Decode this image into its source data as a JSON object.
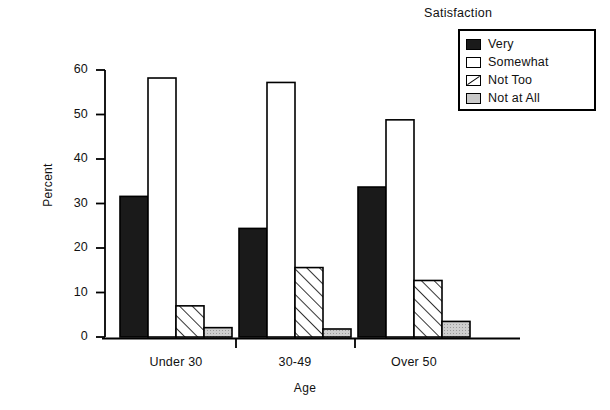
{
  "chart_data": {
    "type": "bar",
    "title": "",
    "xlabel": "Age",
    "ylabel": "Percent",
    "categories": [
      "Under 30",
      "30-49",
      "Over 50"
    ],
    "ylim": [
      0,
      60
    ],
    "yticks": [
      0,
      10,
      20,
      30,
      40,
      50,
      60
    ],
    "ytick_labels": [
      "0",
      "10",
      "20",
      "30",
      "40",
      "50",
      "60"
    ],
    "grid": false,
    "legend_title": "Satisfaction",
    "legend_position": "top-right",
    "series": [
      {
        "name": "Very",
        "pattern": "solid-black",
        "color": "#1a1a1a",
        "values": [
          31.6,
          24.4,
          33.7
        ]
      },
      {
        "name": "Somewhat",
        "pattern": "white",
        "color": "#ffffff",
        "values": [
          58.2,
          57.2,
          48.8
        ]
      },
      {
        "name": "Not Too",
        "pattern": "diagonal",
        "color": "#ffffff",
        "values": [
          7.0,
          15.6,
          12.7
        ]
      },
      {
        "name": "Not at All",
        "pattern": "light-gray",
        "color": "#c9c9c9",
        "values": [
          2.1,
          1.8,
          3.5
        ]
      }
    ]
  },
  "axes": {
    "y_title": "Percent",
    "x_title": "Age",
    "y_labels": [
      "60",
      "50",
      "40",
      "30",
      "20",
      "10",
      "0"
    ],
    "x_labels": [
      "Under 30",
      "30-49",
      "Over 50"
    ]
  },
  "legend": {
    "title": "Satisfaction",
    "items": [
      {
        "label": "Very"
      },
      {
        "label": "Somewhat"
      },
      {
        "label": "Not Too"
      },
      {
        "label": "Not at All"
      }
    ]
  }
}
